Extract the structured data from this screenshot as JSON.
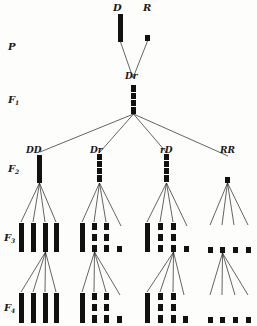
{
  "diagram": {
    "colors": {
      "ink": "#111111",
      "background": "#fdfdfb"
    },
    "generation_labels": [
      {
        "id": "P",
        "label": "P",
        "x": 8,
        "y": 50
      },
      {
        "id": "F1",
        "label": "F1",
        "x": 8,
        "y": 103
      },
      {
        "id": "F2",
        "label": "F2",
        "x": 8,
        "y": 172
      },
      {
        "id": "F3",
        "label": "F3",
        "x": 4,
        "y": 241
      },
      {
        "id": "F4",
        "label": "F4",
        "x": 4,
        "y": 311
      }
    ],
    "parents": {
      "dominant": {
        "label": "D",
        "x": 113,
        "y": 11
      },
      "recessive": {
        "label": "R",
        "x": 143,
        "y": 11
      }
    },
    "f1": {
      "label": "Dr",
      "x": 125,
      "y": 77
    },
    "f2_groups": [
      {
        "label": "DD",
        "x": 26,
        "y": 153
      },
      {
        "label": "Dr",
        "x": 90,
        "y": 153
      },
      {
        "label": "rD",
        "x": 160,
        "y": 153
      },
      {
        "label": "RR",
        "x": 220,
        "y": 153
      }
    ]
  }
}
